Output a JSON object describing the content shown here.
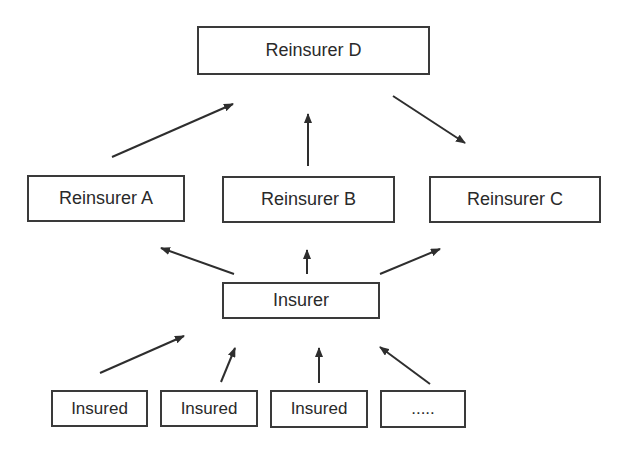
{
  "diagram": {
    "type": "hierarchy",
    "nodes": [
      {
        "id": "reinsurer_d",
        "label": "Reinsurer D",
        "box": [
          197,
          26,
          233,
          49
        ]
      },
      {
        "id": "reinsurer_a",
        "label": "Reinsurer A",
        "box": [
          27,
          175,
          158,
          47
        ]
      },
      {
        "id": "reinsurer_b",
        "label": "Reinsurer B",
        "box": [
          222,
          176,
          173,
          47
        ]
      },
      {
        "id": "reinsurer_c",
        "label": "Reinsurer C",
        "box": [
          429,
          176,
          172,
          47
        ]
      },
      {
        "id": "insurer",
        "label": "Insurer",
        "box": [
          222,
          282,
          158,
          37
        ]
      },
      {
        "id": "insured_1",
        "label": "Insured",
        "box": [
          51,
          390,
          97,
          37
        ]
      },
      {
        "id": "insured_2",
        "label": "Insured",
        "box": [
          160,
          390,
          98,
          37
        ]
      },
      {
        "id": "insured_3",
        "label": "Insured",
        "box": [
          270,
          390,
          98,
          38
        ]
      },
      {
        "id": "insured_more",
        "label": ".....",
        "box": [
          380,
          390,
          86,
          38
        ]
      }
    ],
    "edges": [
      {
        "from": "reinsurer_a",
        "to": "reinsurer_d",
        "line": [
          112,
          157,
          233,
          104
        ]
      },
      {
        "from": "reinsurer_b",
        "to": "reinsurer_d",
        "line": [
          308,
          166,
          308,
          114
        ]
      },
      {
        "from": "reinsurer_d",
        "to": "reinsurer_c",
        "line": [
          393,
          96,
          465,
          143
        ]
      },
      {
        "from": "insurer",
        "to": "reinsurer_a",
        "line": [
          234,
          274,
          161,
          248
        ]
      },
      {
        "from": "insurer",
        "to": "reinsurer_b",
        "line": [
          307,
          274,
          307,
          250
        ]
      },
      {
        "from": "insurer",
        "to": "reinsurer_c",
        "line": [
          380,
          274,
          440,
          249
        ]
      },
      {
        "from": "insured_1",
        "to": "insurer",
        "line": [
          100,
          373,
          184,
          336
        ]
      },
      {
        "from": "insured_2",
        "to": "insurer",
        "line": [
          221,
          382,
          235,
          348
        ]
      },
      {
        "from": "insured_3",
        "to": "insurer",
        "line": [
          319,
          383,
          319,
          348
        ]
      },
      {
        "from": "insured_more",
        "to": "insurer",
        "line": [
          430,
          384,
          380,
          347
        ]
      }
    ]
  },
  "colors": {
    "stroke": "#2e2e2e",
    "background": "#ffffff",
    "text": "#2a2a2a"
  }
}
